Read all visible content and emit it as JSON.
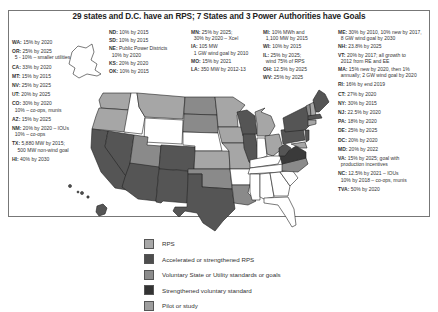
{
  "title": "29 states and D.C. have an RPS; 7 States and 3 Power Authorities have Goals",
  "colors": {
    "rps": "#a6a6a6",
    "accelerated_rps": "#555555",
    "voluntary": "#8a8a8a",
    "strengthened_voluntary": "#3a3a3a",
    "pilot": "#9c9c9c",
    "none": "#ffffff",
    "border": "#222222"
  },
  "notes_left": [
    {
      "state": "WA:",
      "text": "15% by 2020"
    },
    {
      "state": "OR:",
      "text": "25% by 2025",
      "line2": "5 - 10% – smaller utilities"
    },
    {
      "state": "CA:",
      "text": "33% by 2020"
    },
    {
      "state": "MT:",
      "text": "15% by 2015"
    },
    {
      "state": "NV:",
      "text": "25% by 2025"
    },
    {
      "state": "UT:",
      "text": "20% by 2025"
    },
    {
      "state": "CO:",
      "text": "30% by 2020",
      "line2": "10% – co-ops, munis"
    },
    {
      "state": "AZ:",
      "text": "15% by 2025"
    },
    {
      "state": "NM:",
      "text": "20% by 2020 – IOUs",
      "line2": "10% – co-ops"
    },
    {
      "state": "TX:",
      "text": "5,880 MW by 2015;",
      "line2": "500 MW non-wind goal"
    },
    {
      "state": "HI:",
      "text": "40% by 2030"
    }
  ],
  "notes_center_left": [
    {
      "state": "ND:",
      "text": "10% by 2015"
    },
    {
      "state": "SD:",
      "text": "10% by 2015"
    },
    {
      "state": "NE:",
      "text": "Public Power Districts",
      "line2": "10% by 2020"
    },
    {
      "state": "KS:",
      "text": "20% by 2020"
    },
    {
      "state": "OK:",
      "text": "10% by 2015"
    }
  ],
  "notes_center": [
    {
      "state": "MN:",
      "text": "25% by 2025;",
      "line2": "30% by 2020 – Xcel"
    },
    {
      "state": "IA:",
      "text": "105 MW",
      "line2": "1 GW wind goal by 2010"
    },
    {
      "state": "MO:",
      "text": "15% by 2021"
    },
    {
      "state": "LA:",
      "text": "350 MW by 2012-13"
    }
  ],
  "notes_center_right": [
    {
      "state": "MI:",
      "text": "10% MWh and",
      "line2": "1,100 MW by 2015"
    },
    {
      "state": "WI:",
      "text": "10% by 2015"
    },
    {
      "state": "IL:",
      "text": "25% by 2025;",
      "line2": "wind 75% of RPS"
    },
    {
      "state": "OH:",
      "text": "12.5% by 2025"
    },
    {
      "state": "WV:",
      "text": "25% by 2025"
    }
  ],
  "notes_right": [
    {
      "state": "ME:",
      "text": "30% by 2010, 10% new by 2017,",
      "line2": "8 GW wind goal by 2030"
    },
    {
      "state": "NH:",
      "text": "23.8% by 2025"
    },
    {
      "state": "VT:",
      "text": "20% by 2017; all growth to",
      "line2": "2012 from RE and EE"
    },
    {
      "state": "MA:",
      "text": "15% new by 2020, then 1%",
      "line2": "annually; 2 GW wind goal by 2020"
    },
    {
      "state": "RI:",
      "text": "16% by end 2019"
    },
    {
      "state": "CT:",
      "text": "27% by 2020"
    },
    {
      "state": "NY:",
      "text": "30% by 2015"
    },
    {
      "state": "NJ:",
      "text": "22.5% by 2020"
    },
    {
      "state": "PA:",
      "text": "18% by 2020"
    },
    {
      "state": "DE:",
      "text": "25% by 2025"
    },
    {
      "state": "DC:",
      "text": "20% by 2020"
    },
    {
      "state": "MD:",
      "text": "20% by 2022"
    },
    {
      "state": "VA:",
      "text": "15% by 2025; goal with",
      "line2": "production incentives"
    },
    {
      "state": "NC:",
      "text": "12.5% by 2021 – IOUs",
      "line2": "10% by 2018 – co-ops, munis"
    },
    {
      "state": "TVA:",
      "text": "50% by 2020"
    }
  ],
  "legend": [
    {
      "label": "RPS",
      "color": "#a8a8a8"
    },
    {
      "label": "Accelerated or strengthened RPS",
      "color": "#4e4e4e"
    },
    {
      "label": "Voluntary State or Utility standards or goals",
      "color": "#8c8c8c"
    },
    {
      "label": "Strengthened voluntary standard",
      "color": "#333333"
    },
    {
      "label": "Pilot or study",
      "color": "#9e9e9e"
    }
  ]
}
